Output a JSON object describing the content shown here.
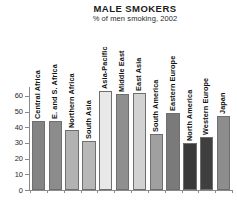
{
  "header": {
    "title": "MALE SMOKERS",
    "subtitle": "% of men smoking, 2002"
  },
  "chart_data": {
    "type": "bar",
    "title": "MALE SMOKERS",
    "subtitle": "% of men smoking, 2002",
    "xlabel": "",
    "ylabel": "",
    "ylim": [
      0,
      65
    ],
    "grid": false,
    "legend": "none",
    "yticks": [
      0,
      10,
      20,
      30,
      40,
      50,
      60
    ],
    "ytick_labels": [
      "0",
      "10",
      "20",
      "30",
      "40",
      "50",
      "60"
    ],
    "categories": [
      "Central Africa",
      "E. and S. Africa",
      "Northern Africa",
      "South Asia",
      "Asia-Pacific",
      "Middle East",
      "East Asia",
      "South America",
      "Eastern Europe",
      "North America",
      "Western Europe",
      "Japan"
    ],
    "values": [
      44,
      44,
      38,
      31,
      63,
      61,
      62,
      36,
      49,
      30,
      34,
      47
    ],
    "bar_colors": [
      "#848484",
      "#8c8c8c",
      "#b2b2b2",
      "#b8b8b8",
      "#e8e8e8",
      "#8f8f8f",
      "#d2d2d2",
      "#a0a0a0",
      "#7a7a7a",
      "#3a3a3a",
      "#3f3f3f",
      "#8d8d8d"
    ]
  }
}
